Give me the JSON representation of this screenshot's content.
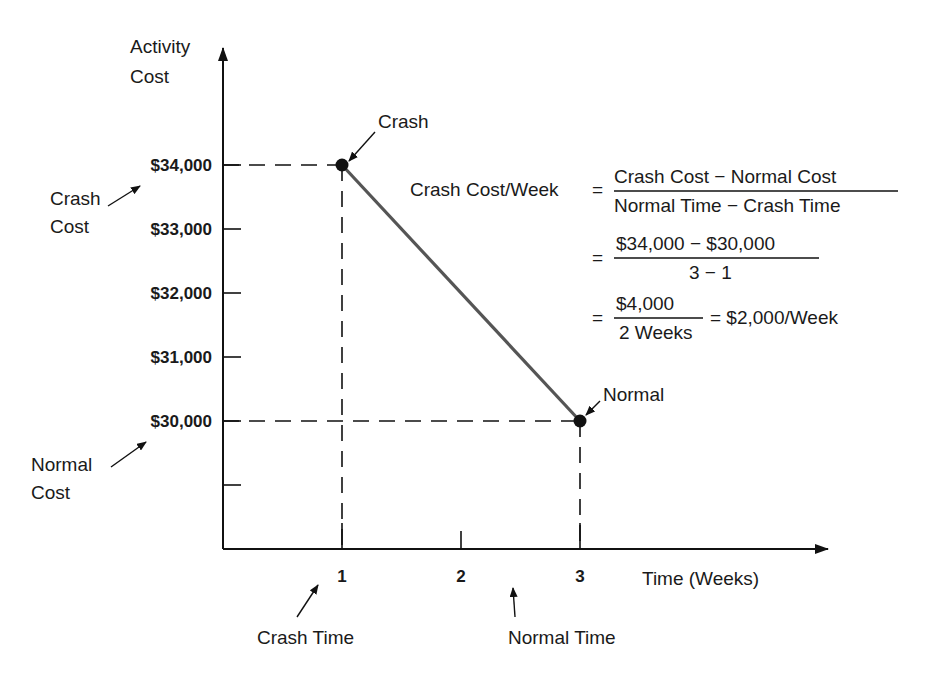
{
  "chart_data": {
    "type": "line",
    "title": "",
    "xlabel": "Time (Weeks)",
    "ylabel_lines": [
      "Activity",
      "Cost"
    ],
    "xlim": [
      0,
      4
    ],
    "ylim": [
      28000,
      35000
    ],
    "grid": false,
    "legend": "none",
    "x_ticks": [
      {
        "value": 1,
        "label": "1"
      },
      {
        "value": 2,
        "label": "2"
      },
      {
        "value": 3,
        "label": "3"
      }
    ],
    "y_ticks": [
      {
        "value": 34000,
        "label": "$34,000"
      },
      {
        "value": 33000,
        "label": "$33,000"
      },
      {
        "value": 32000,
        "label": "$32,000"
      },
      {
        "value": 31000,
        "label": "$31,000"
      },
      {
        "value": 30000,
        "label": "$30,000"
      },
      {
        "value": 29000,
        "label": ""
      }
    ],
    "series": [
      {
        "name": "Time-cost tradeoff",
        "color": "#555555",
        "points": [
          {
            "x": 1,
            "y": 34000,
            "label": "Crash"
          },
          {
            "x": 3,
            "y": 30000,
            "label": "Normal"
          }
        ]
      }
    ],
    "annotations": {
      "crash_cost": {
        "lines": [
          "Crash",
          "Cost"
        ],
        "points_to": 34000
      },
      "normal_cost": {
        "lines": [
          "Normal",
          "Cost"
        ],
        "points_to": 30000
      },
      "crash_time": {
        "text": "Crash Time",
        "points_to": 1
      },
      "normal_time": {
        "text": "Normal Time",
        "points_to": 3
      }
    },
    "formula": {
      "lhs": "Crash Cost/Week",
      "eq": "=",
      "line1": {
        "numerator": "Crash Cost − Normal Cost",
        "denominator": "Normal Time − Crash Time"
      },
      "line2": {
        "numerator": "$34,000 − $30,000",
        "denominator": "3 − 1"
      },
      "line3": {
        "numerator": "$4,000",
        "denominator": "2 Weeks",
        "result": "= $2,000/Week"
      }
    }
  }
}
